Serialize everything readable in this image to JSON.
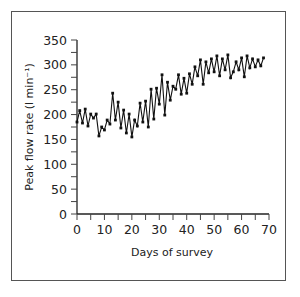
{
  "chart_data": {
    "type": "line",
    "title": "",
    "xlabel": "Days of survey",
    "ylabel": "Peak flow rate (l min⁻¹)",
    "xlim": [
      0,
      70
    ],
    "ylim": [
      0,
      350
    ],
    "x_ticks": [
      0,
      10,
      20,
      30,
      40,
      50,
      60,
      70
    ],
    "y_ticks": [
      0,
      50,
      100,
      150,
      200,
      250,
      300,
      350
    ],
    "grid": false,
    "legend": null,
    "markers": "square",
    "series": [
      {
        "name": "Peak flow rate",
        "x": [
          0,
          1,
          2,
          3,
          4,
          5,
          6,
          7,
          8,
          9,
          10,
          11,
          12,
          13,
          14,
          15,
          16,
          17,
          18,
          19,
          20,
          21,
          22,
          23,
          24,
          25,
          26,
          27,
          28,
          29,
          30,
          31,
          32,
          33,
          34,
          35,
          36,
          37,
          38,
          39,
          40,
          41,
          42,
          43,
          44,
          45,
          46,
          47,
          48,
          49,
          50,
          51,
          52,
          53,
          54,
          55,
          56,
          57,
          58,
          59,
          60,
          61,
          62,
          63,
          64,
          65,
          66,
          67,
          68
        ],
        "values": [
          185,
          208,
          183,
          211,
          177,
          201,
          193,
          201,
          157,
          175,
          169,
          189,
          181,
          243,
          189,
          225,
          173,
          209,
          163,
          201,
          155,
          189,
          177,
          223,
          185,
          227,
          175,
          251,
          191,
          253,
          221,
          280,
          199,
          265,
          229,
          257,
          251,
          280,
          241,
          273,
          243,
          282,
          261,
          296,
          278,
          310,
          261,
          306,
          284,
          312,
          286,
          318,
          278,
          312,
          290,
          320,
          274,
          286,
          306,
          290,
          314,
          276,
          318,
          294,
          312,
          296,
          310,
          298,
          314
        ]
      }
    ]
  },
  "labels": {
    "xlabel": "Days of survey",
    "ylabel": "Peak flow rate (l min⁻¹)"
  }
}
